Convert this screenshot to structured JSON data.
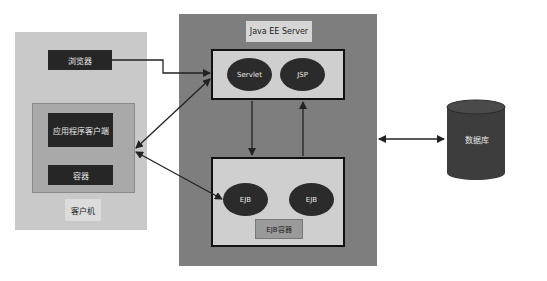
{
  "client": {
    "title": "客户机",
    "browser": "浏览器",
    "app_client": "应用程序客户端",
    "container": "容器"
  },
  "server": {
    "title": "Java EE Server",
    "web": {
      "servlet": "Servlet",
      "jsp": "JSP"
    },
    "ejb": {
      "ejb1": "EJB",
      "ejb2": "EJB",
      "container": "EJB容器"
    }
  },
  "database": {
    "label": "数据库"
  },
  "colors": {
    "client_bg": "#c9c9c9",
    "client_inner_bg": "#a9a9a9",
    "server_bg": "#7e7e7e",
    "container_bg": "#cfcfcf",
    "dark": "#262626",
    "db": "#3d3d3d"
  }
}
